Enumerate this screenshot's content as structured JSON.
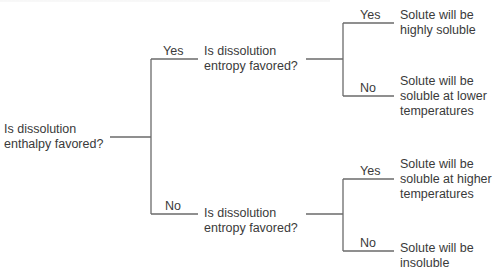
{
  "diagram": {
    "type": "decision-tree",
    "root": {
      "question": [
        "Is dissolution",
        "enthalpy favored?"
      ]
    },
    "branches": [
      {
        "edge_label": "Yes",
        "question": [
          "Is dissolution",
          "entropy favored?"
        ],
        "outcomes": [
          {
            "edge_label": "Yes",
            "text": [
              "Solute will be",
              "highly soluble"
            ]
          },
          {
            "edge_label": "No",
            "text": [
              "Solute will be",
              "soluble at lower",
              "temperatures"
            ]
          }
        ]
      },
      {
        "edge_label": "No",
        "question": [
          "Is dissolution",
          "entropy favored?"
        ],
        "outcomes": [
          {
            "edge_label": "Yes",
            "text": [
              "Solute will be",
              "soluble at higher",
              "temperatures"
            ]
          },
          {
            "edge_label": "No",
            "text": [
              "Solute will be",
              "insoluble"
            ]
          }
        ]
      }
    ],
    "line_color": "#6a6a6a",
    "text_color": "#3a3a3a"
  }
}
